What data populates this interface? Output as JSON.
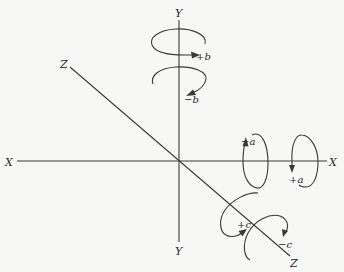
{
  "figure": {
    "background": "#f7f7f5",
    "line_color": "#3a3a3a"
  },
  "axes": {
    "x": {
      "label_neg": "X",
      "label_pos": "X"
    },
    "y": {
      "label_pos": "Y",
      "label_neg": "Y"
    },
    "z": {
      "label_back": "Z",
      "label_front": "Z"
    }
  },
  "rotations": {
    "b_plus": "+b",
    "b_minus": "−b",
    "a_minus": "−a",
    "a_plus": "+a",
    "c_plus": "+c",
    "c_minus": "−c"
  }
}
